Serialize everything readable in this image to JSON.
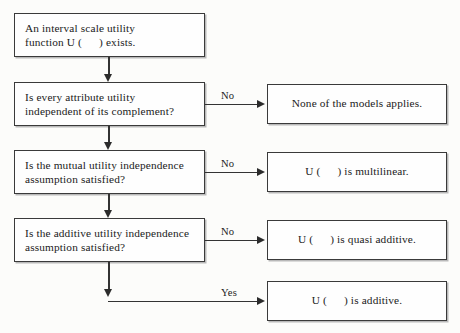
{
  "diagram": {
    "colors": {
      "background": "#fdfdfb",
      "box_fill": "#fefefe",
      "box_border": "#3a3a3a",
      "box_shadow": "#b9b9b9",
      "connector": "#333333",
      "text": "#1b1b1b"
    }
  },
  "nodes": {
    "start": {
      "line1": "An interval scale utility",
      "line2_pre": "function U (",
      "line2_post": ") exists."
    },
    "q1": {
      "line1": "Is every attribute utility",
      "line2": "independent of its complement?"
    },
    "q2": {
      "line1": "Is the mutual utility independence",
      "line2": "assumption satisfied?"
    },
    "q3": {
      "line1": "Is the additive utility independence",
      "line2": "assumption satisfied?"
    },
    "r1": {
      "text": "None of the models applies."
    },
    "r2": {
      "pre": "U (",
      "post": ") is multilinear."
    },
    "r3": {
      "pre": "U (",
      "post": ") is quasi additive."
    },
    "r4": {
      "pre": "U (",
      "post": ") is  additive."
    }
  },
  "edges": {
    "no_1": "No",
    "no_2": "No",
    "no_3": "No",
    "yes_1": "Yes"
  }
}
